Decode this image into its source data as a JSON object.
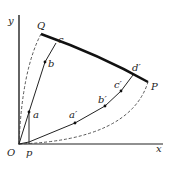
{
  "diagram": {
    "axes": {
      "x_label": "x",
      "y_label": "y",
      "origin_label": "O"
    },
    "points": {
      "Q": "Q",
      "P": "P",
      "p": "p",
      "a": "a",
      "b": "b",
      "c": "c",
      "a_prime": "a′",
      "b_prime": "b′",
      "c_prime": "c′",
      "d_prime": "d′"
    },
    "colors": {
      "line": "#222222",
      "thick": "#111111",
      "dashed": "#444444"
    }
  }
}
